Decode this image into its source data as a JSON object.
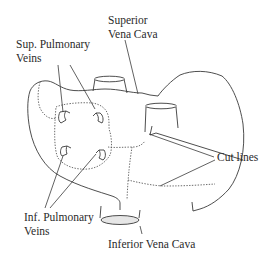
{
  "diagram": {
    "labels": {
      "svc_line1": "Superior",
      "svc_line2": "Vena Cava",
      "spv_line1": "Sup. Pulmonary",
      "spv_line2": "Veins",
      "cut_lines": "Cut lines",
      "ipv_line1": "Inf. Pulmonary",
      "ipv_line2": "Veins",
      "ivc": "Inferior Vena Cava"
    },
    "colors": {
      "stroke": "#3a3a3a",
      "ivc_fill": "#e6e6e6",
      "background": "#ffffff"
    }
  }
}
